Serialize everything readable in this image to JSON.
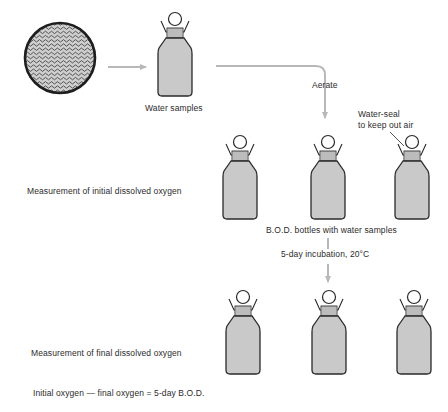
{
  "diagram": {
    "source": {
      "label": "Water body",
      "icon": "water-waves-icon"
    },
    "labels": {
      "water_samples": "Water samples",
      "aerate": "Aerate",
      "water_seal": "Water-seal\nto keep out air",
      "initial_measurement": "Measurement of initial dissolved oxygen",
      "bod_bottles": "B.O.D. bottles with water samples",
      "incubation": "5-day incubation, 20°C",
      "final_measurement": "Measurement of final dissolved oxygen",
      "formula": "Initial oxygen — final oxygen = 5-day B.O.D."
    },
    "rows": [
      {
        "id": "sample",
        "bottle_count": 1
      },
      {
        "id": "initial",
        "bottle_count": 3
      },
      {
        "id": "final",
        "bottle_count": 3
      }
    ],
    "colors": {
      "bottle_fill": "#c9c9c9",
      "outline": "#2a2a2a",
      "arrow": "#b8b8b8",
      "text": "#2b2b2b"
    }
  }
}
